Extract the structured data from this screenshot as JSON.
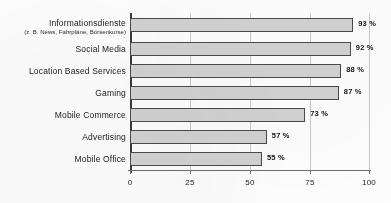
{
  "chart_data": {
    "type": "bar",
    "orientation": "horizontal",
    "title": "",
    "xlabel": "",
    "ylabel": "",
    "xlim": [
      0,
      100
    ],
    "xticks": [
      "0",
      "25",
      "50",
      "75",
      "100"
    ],
    "grid": true,
    "legend": null,
    "value_suffix": "%",
    "categories": [
      "Informationsdienste",
      "Social Media",
      "Location Based Services",
      "Gaming",
      "Mobile Commerce",
      "Advertising",
      "Mobile Office"
    ],
    "category_sublabels": [
      "(z. B. News, Fahrpläne, Börsenkurse)",
      "",
      "",
      "",
      "",
      "",
      ""
    ],
    "values": [
      93,
      92,
      88,
      87,
      73,
      57,
      55
    ],
    "value_labels": [
      "93 %",
      "92 %",
      "88 %",
      "87 %",
      "73 %",
      "57 %",
      "55 %"
    ],
    "colors": {
      "bar_fill": "#d2d2d2",
      "bar_stroke": "#4a4a4a",
      "gridline": "#c9c9c9",
      "axis": "#3a3a3a",
      "text": "#1b1b1b"
    }
  }
}
